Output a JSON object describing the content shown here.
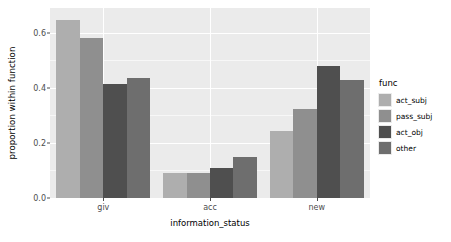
{
  "chart_data": {
    "type": "bar",
    "title": "",
    "xlabel": "information_status",
    "ylabel": "proportion within function",
    "categories": [
      "giv",
      "acc",
      "new"
    ],
    "series": [
      {
        "name": "act_subj",
        "color": "#aeaeae",
        "values": [
          0.645,
          0.09,
          0.245
        ]
      },
      {
        "name": "pass_subj",
        "color": "#8f8f8f",
        "values": [
          0.58,
          0.09,
          0.325
        ]
      },
      {
        "name": "act_obj",
        "color": "#4f4f4f",
        "values": [
          0.415,
          0.11,
          0.48
        ]
      },
      {
        "name": "other",
        "color": "#6e6e6e",
        "values": [
          0.435,
          0.15,
          0.43
        ]
      }
    ],
    "ylim": [
      0,
      0.69
    ],
    "yticks": [
      0.0,
      0.2,
      0.4,
      0.6
    ],
    "ytick_labels": [
      "0.0",
      "0.2",
      "0.4",
      "0.6"
    ],
    "yminor": [
      0.1,
      0.3,
      0.5
    ],
    "grid": true,
    "legend_position": "right",
    "legend_title": "func",
    "panel_background": "#ebebeb",
    "grid_color": "#ffffff"
  }
}
